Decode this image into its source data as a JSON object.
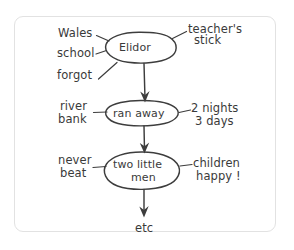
{
  "diagram": {
    "style": {
      "ink_color": "#3d3d3d",
      "frame_color": "#e2e2e2",
      "background_color": "#ffffff"
    },
    "nodes": [
      {
        "id": "node-1",
        "label": "Elidor",
        "label_lines": [
          "Elidor"
        ]
      },
      {
        "id": "node-2",
        "label": "ran away",
        "label_lines": [
          "ran away"
        ]
      },
      {
        "id": "node-3",
        "label": "two little men",
        "label_lines": [
          "two little",
          "men"
        ]
      }
    ],
    "left_annotations": [
      {
        "for": "node-1",
        "lines": [
          "Wales",
          "school",
          "forgot"
        ]
      },
      {
        "for": "node-2",
        "lines": [
          "river",
          "bank"
        ]
      },
      {
        "for": "node-3",
        "lines": [
          "never",
          "beat"
        ]
      }
    ],
    "right_annotations": [
      {
        "for": "node-1",
        "lines": [
          "teacher's",
          "stick"
        ]
      },
      {
        "for": "node-2",
        "lines": [
          "2 nights",
          "3 days"
        ]
      },
      {
        "for": "node-3",
        "lines": [
          "children",
          "happy !"
        ]
      }
    ],
    "terminal_label": "etc",
    "labels": {
      "n1_wales": "Wales",
      "n1_school": "school",
      "n1_forgot": "forgot",
      "n1_teachers": "teacher's",
      "n1_stick": "stick",
      "n1_node": "Elidor",
      "n2_river": "river",
      "n2_bank": "bank",
      "n2_node": "ran away",
      "n2_nights": "2 nights",
      "n2_days": "3 days",
      "n3_never": "never",
      "n3_beat": "beat",
      "n3_node_line1": "two little",
      "n3_node_line2": "men",
      "n3_children": "children",
      "n3_happy": "happy !",
      "etc": "etc"
    }
  }
}
